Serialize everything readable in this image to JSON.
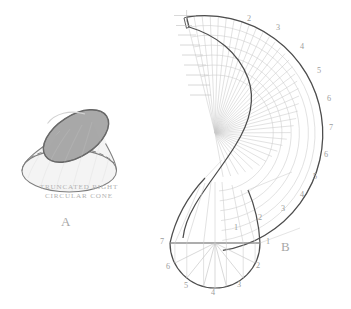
{
  "figure": {
    "background_color": "#ffffff",
    "ink_color": "#8c8c8c",
    "dark_ink_color": "#555555",
    "grid_color": "#c4c4c4",
    "solid_fill_color": "#a8a8a8",
    "body_fill_color": "#f2f2f2"
  },
  "panel_a": {
    "label": "A",
    "caption_line1": "TRUNCATED RIGHT",
    "caption_line2": "CIRCULAR CONE",
    "shape_name": "truncated right circular cone",
    "top_face": "elliptical cut face",
    "base": "circular base with hidden dashed edge"
  },
  "panel_b": {
    "label": "B",
    "title": "radial line development of truncated cone",
    "apex": {
      "x": 215,
      "y": 133
    },
    "development": {
      "inner_radius": 58,
      "outer_radius": 118,
      "start_angle_deg": -104,
      "end_angle_deg": 56,
      "element_count": 25,
      "arc_count": 7
    },
    "outer_arc_labels": [
      "2",
      "3",
      "4",
      "5",
      "6",
      "7",
      "6",
      "5",
      "4",
      "3",
      "2",
      "1"
    ],
    "outer_arc_label_positions": [
      {
        "label": "2",
        "x": 247,
        "y": 14
      },
      {
        "label": "3",
        "x": 276,
        "y": 23
      },
      {
        "label": "4",
        "x": 300,
        "y": 42
      },
      {
        "label": "5",
        "x": 317,
        "y": 66
      },
      {
        "label": "6",
        "x": 327,
        "y": 94
      },
      {
        "label": "7",
        "x": 329,
        "y": 123
      },
      {
        "label": "6",
        "x": 324,
        "y": 150
      },
      {
        "label": "5",
        "x": 313,
        "y": 172
      },
      {
        "label": "4",
        "x": 300,
        "y": 190
      },
      {
        "label": "3",
        "x": 281,
        "y": 204
      },
      {
        "label": "2",
        "x": 258,
        "y": 213
      },
      {
        "label": "1",
        "x": 234,
        "y": 223
      }
    ],
    "plan_view": {
      "shape": "semicircular bottom plan",
      "center": {
        "x": 215,
        "y": 243
      },
      "radius": 45,
      "point_count": 7,
      "point_labels": [
        "7",
        "6",
        "5",
        "4",
        "3",
        "2",
        "1"
      ],
      "point_label_positions": [
        {
          "label": "7",
          "x": 160,
          "y": 237
        },
        {
          "label": "6",
          "x": 166,
          "y": 262
        },
        {
          "label": "5",
          "x": 184,
          "y": 281
        },
        {
          "label": "4",
          "x": 211,
          "y": 288
        },
        {
          "label": "3",
          "x": 237,
          "y": 280
        },
        {
          "label": "2",
          "x": 256,
          "y": 261
        },
        {
          "label": "1",
          "x": 266,
          "y": 237
        }
      ]
    }
  }
}
